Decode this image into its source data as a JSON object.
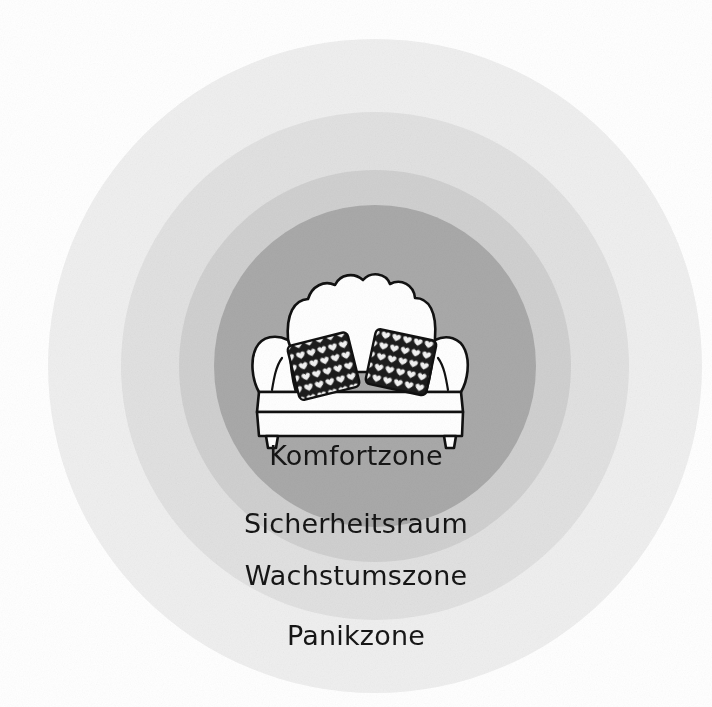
{
  "diagram": {
    "type": "concentric-zones",
    "background_color": "#ffffff"
  },
  "zones": [
    {
      "id": "panikzone",
      "label": "Panikzone",
      "order": 4,
      "color": "#efefef",
      "diameter_px": 654,
      "label_color": "#161616"
    },
    {
      "id": "wachstumszone",
      "label": "Wachstumszone",
      "order": 3,
      "color": "#e1e1e1",
      "diameter_px": 508,
      "label_color": "#161616"
    },
    {
      "id": "sicherheitsraum",
      "label": "Sicherheitsraum",
      "order": 2,
      "color": "#d0d0d0",
      "diameter_px": 392,
      "label_color": "#161616"
    },
    {
      "id": "komfortzone",
      "label": "Komfortzone",
      "order": 1,
      "color": "#a9a9a9",
      "diameter_px": 322,
      "label_color": "#161616"
    }
  ],
  "illustration": {
    "name": "sofa-illustration",
    "description": "Sofa",
    "line_color": "#111111",
    "fill_color": "#ffffff",
    "cushion_color": "#1c1c1c",
    "cushion_motif": "heart"
  }
}
